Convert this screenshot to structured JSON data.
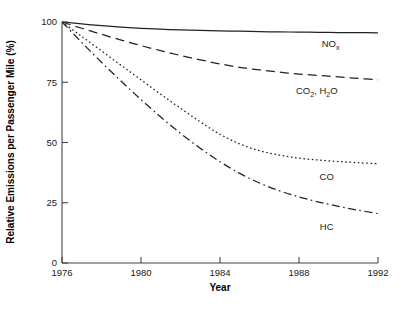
{
  "chart_data": {
    "type": "line",
    "title": "",
    "xlabel": "Year",
    "ylabel": "Relative Emissions per Passenger Mile (%)",
    "xlim": [
      1976,
      1992
    ],
    "ylim": [
      0,
      100
    ],
    "xticks": [
      1976,
      1980,
      1984,
      1988,
      1992
    ],
    "yticks": [
      0,
      25,
      50,
      75,
      100
    ],
    "xtick_labels": [
      "1976",
      "1980",
      "1984",
      "1988",
      "1992"
    ],
    "ytick_labels": [
      "0",
      "25",
      "50",
      "75",
      "100"
    ],
    "grid": false,
    "legend": "inline-labels-right",
    "x": [
      1976,
      1977,
      1978,
      1979,
      1980,
      1981,
      1982,
      1983,
      1984,
      1985,
      1986,
      1987,
      1988,
      1989,
      1990,
      1991,
      1992
    ],
    "series": [
      {
        "name": "NOx",
        "label_main": "NO",
        "label_sub": "x",
        "linestyle": "solid",
        "color": "#222222",
        "values": [
          100,
          99.2,
          98.5,
          97.9,
          97.4,
          97.0,
          96.7,
          96.5,
          96.3,
          96.2,
          96.0,
          95.9,
          95.8,
          95.7,
          95.6,
          95.6,
          95.5
        ],
        "label_x": 1989.6,
        "label_y": 89.5
      },
      {
        "name": "CO2, H2O",
        "label_main": "CO",
        "label_sub": "2",
        "label_main2": ", H",
        "label_sub2": "2",
        "label_main3": "O",
        "linestyle": "longdash",
        "color": "#222222",
        "values": [
          100,
          97.4,
          94.9,
          92.5,
          90.2,
          88.1,
          86.1,
          84.3,
          82.6,
          81.2,
          80.1,
          79.2,
          78.4,
          77.8,
          77.2,
          76.6,
          76.0
        ],
        "label_x": 1988.9,
        "label_y": 70.0
      },
      {
        "name": "CO",
        "label_main": "CO",
        "linestyle": "dotted",
        "color": "#222222",
        "values": [
          100,
          94.0,
          88.0,
          82.0,
          76.0,
          70.0,
          64.2,
          58.6,
          53.4,
          49.4,
          46.6,
          44.8,
          43.5,
          42.7,
          42.1,
          41.6,
          41.2
        ],
        "label_x": 1989.4,
        "label_y": 34.5
      },
      {
        "name": "HC",
        "label_main": "HC",
        "linestyle": "dashdot",
        "color": "#222222",
        "values": [
          100,
          91.5,
          83.3,
          75.4,
          67.8,
          60.6,
          53.8,
          47.6,
          42.0,
          37.2,
          33.2,
          30.0,
          27.4,
          25.3,
          23.5,
          21.9,
          20.5
        ],
        "label_x": 1989.4,
        "label_y": 13.5
      }
    ]
  },
  "axes": {
    "x_title": "Year",
    "y_title": "Relative Emissions per Passenger Mile (%)"
  }
}
